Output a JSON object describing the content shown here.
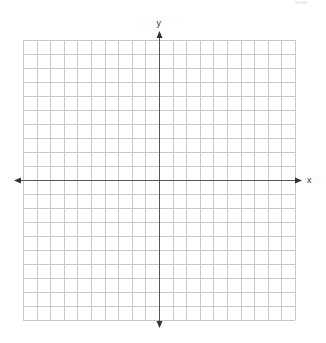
{
  "diagram": {
    "type": "coordinate-grid",
    "corner_text": "ᴺᴬᴹᴱ",
    "x_axis": {
      "label": "x",
      "arrows": "both"
    },
    "y_axis": {
      "label": "y",
      "arrows": "both"
    },
    "grid": {
      "columns": 20,
      "rows": 20,
      "left": 23,
      "top": 40,
      "right": 295,
      "bottom": 320,
      "line_color": "#c8c8c8",
      "axis_color": "#555555"
    },
    "axes_origin": {
      "x": 159,
      "y": 180
    },
    "x_axis_extent": {
      "from": 14,
      "to": 302
    },
    "y_axis_extent": {
      "from": 31,
      "to": 328
    }
  }
}
